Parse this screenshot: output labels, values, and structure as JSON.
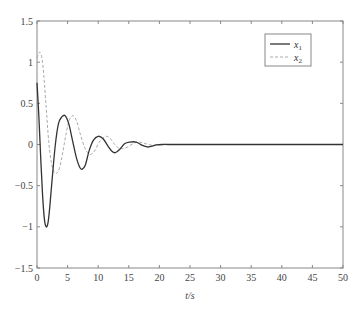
{
  "chart_data": {
    "type": "line",
    "title": "",
    "xlabel": "t/s",
    "ylabel": "",
    "xlim": [
      0,
      50
    ],
    "ylim": [
      -1.5,
      1.5
    ],
    "grid": false,
    "legend_position": "upper right",
    "x_ticks": [
      0,
      5,
      10,
      15,
      20,
      25,
      30,
      35,
      40,
      45,
      50
    ],
    "x_tick_labels": [
      "0",
      "5",
      "10",
      "15",
      "20",
      "25",
      "30",
      "35",
      "40",
      "45",
      "50"
    ],
    "y_ticks": [
      1.5,
      1,
      0.5,
      0,
      -0.5,
      -1,
      -1.5
    ],
    "y_tick_labels": [
      "1.5",
      "1",
      "0.5",
      "0",
      "−0.5",
      "−1",
      "−1.5"
    ],
    "series": [
      {
        "name": "x1",
        "legend_label": "x",
        "legend_sub": "1",
        "style": "solid",
        "color": "#333333",
        "x": [
          0,
          0.3,
          0.6,
          0.9,
          1.2,
          1.5,
          1.8,
          2.1,
          2.5,
          3.0,
          3.5,
          4.0,
          4.6,
          5.2,
          5.8,
          6.4,
          7.0,
          7.4,
          7.9,
          8.5,
          9.2,
          10.0,
          10.8,
          11.6,
          12.2,
          12.8,
          13.5,
          14.3,
          15.2,
          16.2,
          17.2,
          18.0,
          18.8,
          19.5,
          20.5,
          22,
          25,
          30,
          35,
          40,
          45,
          50
        ],
        "y": [
          0.75,
          0.35,
          -0.15,
          -0.6,
          -0.9,
          -1.0,
          -0.95,
          -0.75,
          -0.4,
          0.0,
          0.25,
          0.33,
          0.35,
          0.25,
          0.05,
          -0.15,
          -0.28,
          -0.3,
          -0.25,
          -0.08,
          0.05,
          0.1,
          0.07,
          -0.02,
          -0.08,
          -0.1,
          -0.06,
          0.01,
          0.03,
          0.03,
          -0.01,
          -0.03,
          -0.02,
          -0.005,
          0,
          0,
          0,
          0,
          0,
          0,
          0,
          0
        ]
      },
      {
        "name": "x2",
        "legend_label": "x",
        "legend_sub": "2",
        "style": "dashed",
        "color": "#aaaaaa",
        "x": [
          0,
          0.25,
          0.5,
          0.8,
          1.1,
          1.5,
          1.9,
          2.3,
          2.7,
          3.2,
          3.7,
          4.2,
          4.8,
          5.3,
          5.9,
          6.5,
          7.1,
          7.8,
          8.4,
          8.8,
          9.4,
          10.1,
          10.8,
          11.3,
          11.9,
          12.6,
          13.3,
          14.0,
          14.8,
          15.7,
          16.5,
          17.3,
          18.2,
          19.0,
          20,
          22,
          25,
          30,
          35,
          40,
          45,
          50
        ],
        "y": [
          1.05,
          1.1,
          1.12,
          1.05,
          0.85,
          0.45,
          0.05,
          -0.2,
          -0.32,
          -0.35,
          -0.28,
          -0.1,
          0.15,
          0.3,
          0.35,
          0.28,
          0.12,
          -0.04,
          -0.11,
          -0.12,
          -0.08,
          0.02,
          0.08,
          0.1,
          0.08,
          0.01,
          -0.04,
          -0.05,
          -0.03,
          0.01,
          0.03,
          0.02,
          0.0,
          -0.01,
          0,
          0,
          0,
          0,
          0,
          0,
          0,
          0
        ]
      }
    ]
  },
  "plot_area": {
    "left": 37,
    "top": 21,
    "right": 343,
    "bottom": 268
  },
  "colors": {
    "axis": "#888888",
    "text": "#444444",
    "legend_border": "#888888"
  }
}
